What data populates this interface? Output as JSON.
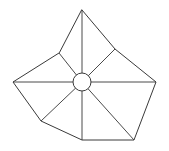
{
  "diagram": {
    "type": "polygon-with-hub",
    "stroke_color": "#3a3a3a",
    "background": "#ffffff",
    "hub": {
      "cx": 82,
      "cy": 82,
      "r": 9
    },
    "outer_vertices": [
      {
        "name": "top",
        "x": 82,
        "y": 10
      },
      {
        "name": "upper-right",
        "x": 115,
        "y": 49
      },
      {
        "name": "right",
        "x": 156,
        "y": 82
      },
      {
        "name": "bottom-right",
        "x": 134,
        "y": 140
      },
      {
        "name": "bottom",
        "x": 82,
        "y": 140
      },
      {
        "name": "lower-left",
        "x": 41,
        "y": 121
      },
      {
        "name": "left",
        "x": 13,
        "y": 82
      },
      {
        "name": "upper-left",
        "x": 59,
        "y": 53
      }
    ]
  }
}
